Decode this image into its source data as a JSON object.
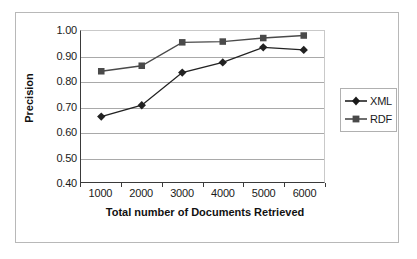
{
  "chart_data": {
    "type": "line",
    "title": "",
    "xlabel": "Total number of Documents Retrieved",
    "ylabel": "Precision",
    "categories": [
      "1000",
      "2000",
      "3000",
      "4000",
      "5000",
      "6000"
    ],
    "x": [
      1000,
      2000,
      3000,
      4000,
      5000,
      6000
    ],
    "ylim": [
      0.4,
      1.0
    ],
    "yticks": [
      "0.40",
      "0.50",
      "0.60",
      "0.70",
      "0.80",
      "0.90",
      "1.00"
    ],
    "ytick_values": [
      0.4,
      0.5,
      0.6,
      0.7,
      0.8,
      0.9,
      1.0
    ],
    "grid": true,
    "legend_position": "right",
    "series": [
      {
        "name": "XML",
        "marker": "diamond",
        "color": "#222222",
        "values": [
          0.66,
          0.705,
          0.835,
          0.875,
          0.935,
          0.925
        ]
      },
      {
        "name": "RDF",
        "marker": "square",
        "color": "#4a4a4a",
        "values": [
          0.84,
          0.862,
          0.955,
          0.958,
          0.972,
          0.982
        ]
      }
    ]
  },
  "legend": {
    "entries": [
      {
        "label": "XML"
      },
      {
        "label": "RDF"
      }
    ]
  }
}
